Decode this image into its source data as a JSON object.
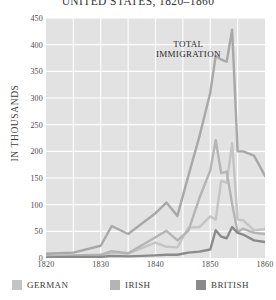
{
  "chart_data": {
    "type": "line",
    "title": "UNITED STATES, 1820–1860",
    "xlabel": "",
    "ylabel": "IN THOUSANDS",
    "xlim": [
      1820,
      1860
    ],
    "ylim": [
      0,
      450
    ],
    "grid": true,
    "legend_position": "bottom",
    "annotations": [
      {
        "text_line1": "TOTAL",
        "text_line2": "IMMIGRATION",
        "x": 1846,
        "y": 400
      }
    ],
    "xticks": [
      1820,
      1830,
      1840,
      1850,
      1860
    ],
    "yticks": [
      0,
      50,
      100,
      150,
      200,
      250,
      300,
      350,
      400,
      450
    ],
    "colors": {
      "total": "#a8a8a8",
      "german": "#c4c4c4",
      "irish": "#b4b4b4",
      "british": "#8a8a8a"
    },
    "x": [
      1820,
      1825,
      1830,
      1832,
      1835,
      1840,
      1842,
      1844,
      1846,
      1848,
      1850,
      1851,
      1852,
      1853,
      1854,
      1855,
      1856,
      1858,
      1860
    ],
    "series": [
      {
        "name": "TOTAL IMMIGRATION",
        "key": "total",
        "values": [
          8,
          10,
          23,
          60,
          45,
          84,
          104,
          79,
          154,
          227,
          310,
          379,
          372,
          368,
          428,
          200,
          200,
          192,
          154
        ]
      },
      {
        "name": "GERMAN",
        "key": "german",
        "values": [
          1,
          1,
          2,
          10,
          8,
          29,
          21,
          20,
          57,
          58,
          78,
          72,
          145,
          141,
          215,
          72,
          71,
          52,
          54
        ]
      },
      {
        "name": "IRISH",
        "key": "irish",
        "values": [
          4,
          5,
          6,
          13,
          9,
          39,
          51,
          33,
          51,
          112,
          164,
          221,
          159,
          162,
          101,
          49,
          55,
          47,
          45
        ]
      },
      {
        "name": "BRITISH",
        "key": "british",
        "values": [
          1,
          2,
          2,
          4,
          3,
          5,
          6,
          6,
          10,
          12,
          16,
          52,
          40,
          37,
          58,
          47,
          44,
          33,
          30
        ]
      }
    ]
  },
  "legend": {
    "items": [
      {
        "label": "GERMAN",
        "color": "#c4c4c4"
      },
      {
        "label": "IRISH",
        "color": "#b4b4b4"
      },
      {
        "label": "BRITISH",
        "color": "#8a8a8a"
      }
    ]
  }
}
